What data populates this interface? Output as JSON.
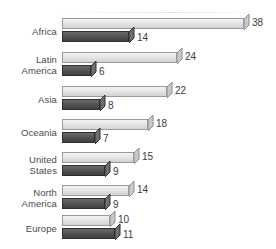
{
  "chart_data": {
    "type": "bar",
    "orientation": "horizontal",
    "title": "",
    "subtitle": "",
    "xlabel": "",
    "ylabel": "",
    "grid": false,
    "legend": "none",
    "axis_visible": false,
    "value_labels": true,
    "xlim": [
      0,
      38
    ],
    "categories": [
      "Africa",
      "Latin\nAmerica",
      "Asia",
      "Oceania",
      "United\nStates",
      "North\nAmerica",
      "Europe"
    ],
    "series": [
      {
        "name": "series-1",
        "style": "light",
        "color": "#e6e6e6",
        "values": [
          38,
          24,
          22,
          18,
          15,
          14,
          10
        ]
      },
      {
        "name": "series-2",
        "style": "dark",
        "color": "#575757",
        "values": [
          14,
          6,
          8,
          7,
          9,
          9,
          11
        ]
      }
    ]
  },
  "colors": {
    "light_bar": "#e6e6e6",
    "light_bar_edge": "#9a9a9a",
    "dark_bar": "#575757",
    "dark_bar_edge": "#2e2e2e",
    "label_text": "#4a4a4a",
    "value_text": "#3a3a3a",
    "background": "#ffffff"
  }
}
